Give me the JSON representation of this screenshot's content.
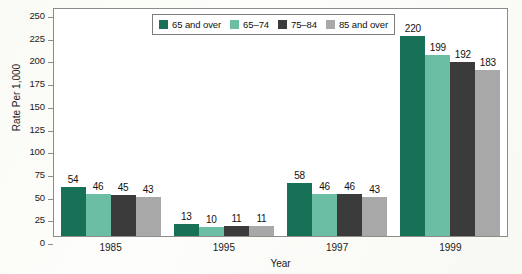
{
  "chart_data": {
    "type": "bar",
    "title": "",
    "xlabel": "Year",
    "ylabel": "Rate Per 1,000",
    "categories": [
      "1985",
      "1995",
      "1997",
      "1999"
    ],
    "series": [
      {
        "name": "65 and over",
        "color": "#177157",
        "values": [
          54,
          13,
          58,
          220
        ]
      },
      {
        "name": "65–74",
        "color": "#6bbda4",
        "values": [
          46,
          10,
          46,
          199
        ]
      },
      {
        "name": "75–84",
        "color": "#3b3b3b",
        "values": [
          45,
          11,
          46,
          192
        ]
      },
      {
        "name": "85 and over",
        "color": "#a8a8a8",
        "values": [
          43,
          11,
          43,
          183
        ]
      }
    ],
    "grouped_values": {
      "1985": {
        "65 and over": 54,
        "65–74": 13,
        "75–84": 58,
        "85 and over": 220
      },
      "1995": {
        "65 and over": 46,
        "65–74": 10,
        "75–84": 46,
        "85 and over": 199
      },
      "1997": {
        "65 and over": 45,
        "65–74": 11,
        "75–84": 46,
        "85 and over": 192
      },
      "1999": {
        "65 and over": 43,
        "65–74": 11,
        "75–84": 43,
        "85 and over": 183
      }
    },
    "ylim": [
      0,
      250
    ],
    "yticks": [
      0,
      25,
      50,
      75,
      100,
      125,
      150,
      175,
      200,
      225,
      250
    ],
    "ytick_labels": [
      "0",
      "25",
      "50",
      "75",
      "100",
      "125",
      "150",
      "175",
      "200",
      "225",
      "250"
    ],
    "grid": false,
    "legend_position": "top-center",
    "data_labels": true
  },
  "legend": {
    "items": [
      {
        "label": "65 and over",
        "color": "#177157"
      },
      {
        "label": "65–74",
        "color": "#6bbda4"
      },
      {
        "label": "75–84",
        "color": "#3b3b3b"
      },
      {
        "label": "85 and over",
        "color": "#a8a8a8"
      }
    ]
  },
  "axes": {
    "y_title": "Rate Per 1,000",
    "x_title": "Year"
  },
  "colors": {
    "series_1": "#177157",
    "series_2": "#6bbda4",
    "series_3": "#3b3b3b",
    "series_4": "#a8a8a8",
    "frame": "#8c8c8c",
    "plot_background": "#ffffff",
    "page_background": "#fdfdfb"
  }
}
